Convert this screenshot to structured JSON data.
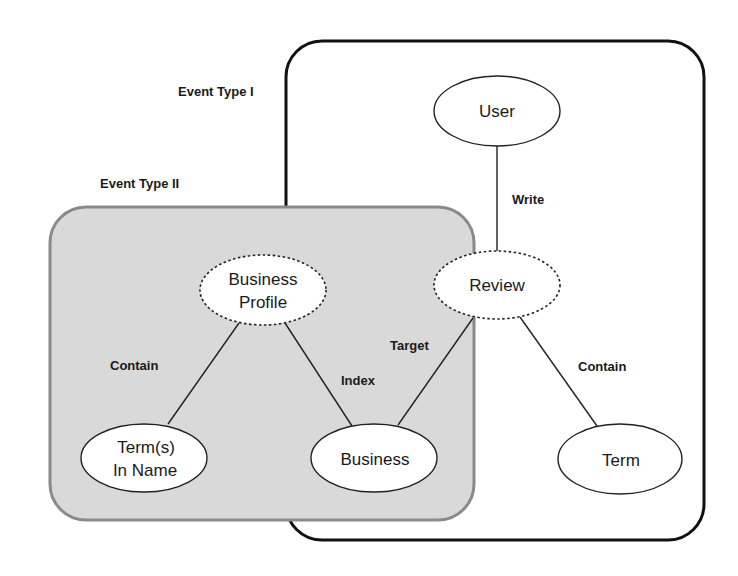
{
  "diagram": {
    "groups": [
      {
        "id": "event-type-1",
        "label": "Event Type I",
        "style": "outline",
        "border_color": "#111111",
        "fill": "#ffffff"
      },
      {
        "id": "event-type-2",
        "label": "Event Type II",
        "style": "shaded",
        "border_color": "#8a8a8a",
        "fill": "#d9d9d9"
      }
    ],
    "nodes": [
      {
        "id": "user",
        "lines": [
          "User"
        ],
        "border": "solid"
      },
      {
        "id": "review",
        "lines": [
          "Review"
        ],
        "border": "dashed"
      },
      {
        "id": "business-profile",
        "lines": [
          "Business",
          "Profile"
        ],
        "border": "dashed"
      },
      {
        "id": "terms-in-name",
        "lines": [
          "Term(s)",
          "In Name"
        ],
        "border": "solid"
      },
      {
        "id": "business",
        "lines": [
          "Business"
        ],
        "border": "solid"
      },
      {
        "id": "term",
        "lines": [
          "Term"
        ],
        "border": "solid"
      }
    ],
    "edges": [
      {
        "from": "user",
        "to": "review",
        "label": "Write"
      },
      {
        "from": "business-profile",
        "to": "terms-in-name",
        "label": "Contain"
      },
      {
        "from": "business-profile",
        "to": "business",
        "label": "Index"
      },
      {
        "from": "review",
        "to": "business",
        "label": "Target"
      },
      {
        "from": "review",
        "to": "term",
        "label": "Contain"
      }
    ]
  }
}
